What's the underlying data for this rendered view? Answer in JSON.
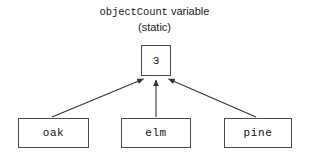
{
  "diagram": {
    "title": {
      "variable_name": "objectCount",
      "variable_word": "variable",
      "qualifier": "(static)"
    },
    "static_variable_box": {
      "name": "objectCount",
      "value": "3"
    },
    "object_boxes": [
      {
        "label": "oak"
      },
      {
        "label": "elm"
      },
      {
        "label": "pine"
      }
    ],
    "arrows": [
      {
        "from": "oak",
        "to": "objectCount"
      },
      {
        "from": "elm",
        "to": "objectCount"
      },
      {
        "from": "pine",
        "to": "objectCount"
      }
    ],
    "colors": {
      "background": "#ffffff",
      "box_border": "#4a4a4a",
      "arrow": "#333333",
      "text": "#111111"
    }
  }
}
